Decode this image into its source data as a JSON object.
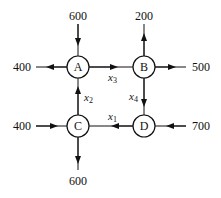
{
  "nodes": [
    {
      "id": "A",
      "label": "A",
      "x": 78,
      "y": 67
    },
    {
      "id": "B",
      "label": "B",
      "x": 144,
      "y": 67
    },
    {
      "id": "C",
      "label": "C",
      "x": 78,
      "y": 126
    },
    {
      "id": "D",
      "label": "D",
      "x": 144,
      "y": 126
    }
  ],
  "external_flows": [
    {
      "node": "A",
      "value": "600",
      "direction": "in",
      "side": "top"
    },
    {
      "node": "A",
      "value": "400",
      "direction": "out",
      "side": "left"
    },
    {
      "node": "B",
      "value": "200",
      "direction": "out",
      "side": "top"
    },
    {
      "node": "B",
      "value": "500",
      "direction": "out",
      "side": "right"
    },
    {
      "node": "C",
      "value": "400",
      "direction": "in",
      "side": "left"
    },
    {
      "node": "C",
      "value": "600",
      "direction": "out",
      "side": "bottom"
    },
    {
      "node": "D",
      "value": "700",
      "direction": "in",
      "side": "right"
    }
  ],
  "internal_flows": [
    {
      "from": "A",
      "to": "B",
      "var": "x",
      "sub": "3"
    },
    {
      "from": "B",
      "to": "D",
      "var": "x",
      "sub": "4"
    },
    {
      "from": "D",
      "to": "C",
      "var": "x",
      "sub": "1"
    },
    {
      "from": "C",
      "to": "A",
      "var": "x",
      "sub": "2"
    }
  ],
  "labels": {
    "a_top": "600",
    "a_left": "400",
    "b_top": "200",
    "b_right": "500",
    "c_left": "400",
    "c_bottom": "600",
    "d_right": "700",
    "nA": "A",
    "nB": "B",
    "nC": "C",
    "nD": "D",
    "x": "x",
    "s1": "1",
    "s2": "2",
    "s3": "3",
    "s4": "4"
  }
}
